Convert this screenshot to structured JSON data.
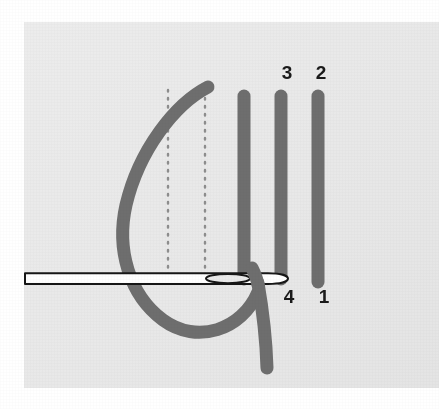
{
  "figure": {
    "canvas": {
      "width": 439,
      "height": 409
    },
    "colors": {
      "page_background": "#ffffff",
      "panel_background": "#e9e9e9",
      "thread": "#6e6e6e",
      "needle_outline": "#161616",
      "needle_fill": "#ffffff",
      "dotted_guide": "#8e8e8e",
      "label_text": "#1a1a1a"
    },
    "panel": {
      "x": 24,
      "y": 22,
      "width": 415,
      "height": 366
    }
  },
  "labels": [
    {
      "id": "label-3",
      "text": "3",
      "x": 287,
      "y": 79,
      "position": "top"
    },
    {
      "id": "label-2",
      "text": "2",
      "x": 321,
      "y": 79,
      "position": "top"
    },
    {
      "id": "label-4",
      "text": "4",
      "x": 289,
      "y": 303,
      "position": "bottom"
    },
    {
      "id": "label-1",
      "text": "1",
      "x": 324,
      "y": 303,
      "position": "bottom"
    }
  ],
  "bars": [
    {
      "id": "bar-left",
      "x": 244,
      "top": 90,
      "bottom": 285,
      "width": 13
    },
    {
      "id": "bar-middle",
      "x": 281,
      "top": 90,
      "bottom": 285,
      "width": 13
    },
    {
      "id": "bar-right",
      "x": 318,
      "top": 90,
      "bottom": 288,
      "width": 13
    }
  ],
  "guides": [
    {
      "id": "dotted-guide-left",
      "x": 168,
      "top": 90,
      "bottom": 276
    },
    {
      "id": "dotted-guide-right",
      "x": 205,
      "top": 90,
      "bottom": 276
    }
  ],
  "needle": {
    "id": "needle",
    "shaft_y_top": 274,
    "shaft_y_bottom": 283,
    "shaft_x_start": 25,
    "tip_x_end": 288,
    "eye": {
      "cx": 228,
      "cy": 279,
      "rx": 22,
      "ry": 6
    }
  },
  "thread": {
    "id": "working-thread",
    "stroke_width": 13,
    "top_end": {
      "x": 208,
      "y": 87
    },
    "left_extent_x": 120,
    "bottom_extent_y": 334,
    "tail_end": {
      "x": 267,
      "y": 374
    }
  }
}
